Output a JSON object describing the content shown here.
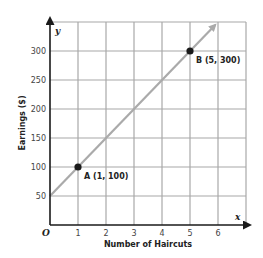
{
  "chart_data": {
    "type": "line",
    "title": "",
    "xlabel": "Number of Haircuts",
    "ylabel": "Earnings ($)",
    "x_axis_var": "x",
    "y_axis_var": "y",
    "origin_label": "O",
    "xlim": [
      0,
      7
    ],
    "ylim": [
      0,
      350
    ],
    "x_ticks": [
      "1",
      "2",
      "3",
      "4",
      "5",
      "6"
    ],
    "y_ticks": [
      "50",
      "100",
      "150",
      "200",
      "250",
      "300"
    ],
    "grid": true,
    "series": [
      {
        "name": "Earnings line",
        "x": [
          0,
          1,
          5,
          5.9
        ],
        "y": [
          50,
          100,
          300,
          345
        ],
        "color": "#aaaaaa",
        "arrow_end": true
      }
    ],
    "points": [
      {
        "label": "A (1, 100)",
        "x": 1,
        "y": 100
      },
      {
        "label": "B (5, 300)",
        "x": 5,
        "y": 300
      }
    ]
  }
}
